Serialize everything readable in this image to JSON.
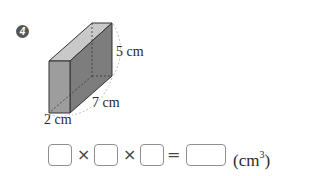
{
  "problem": {
    "number": "4",
    "figure": {
      "shape": "rectangular-prism",
      "dimensions": {
        "height_label": "5 cm",
        "length_label": "7 cm",
        "width_label": "2 cm"
      },
      "colors": {
        "front_face": "#9b9b9b",
        "top_face": "#c4c4c4",
        "side_face": "#7f7f7f",
        "edge": "#333333"
      }
    },
    "equation": {
      "operators": [
        "×",
        "×",
        "="
      ],
      "unit": "(cm",
      "unit_exponent": "3",
      "unit_close": ")",
      "blank_count": 4
    }
  }
}
